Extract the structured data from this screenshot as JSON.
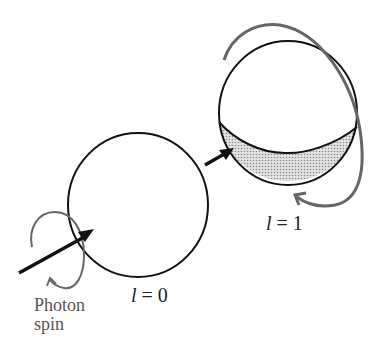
{
  "diagram": {
    "labels": {
      "l0": {
        "symbol": "l",
        "rest": " = 0"
      },
      "l1": {
        "symbol": "l",
        "rest": " = 1"
      },
      "photon_line1": "Photon",
      "photon_line2": "spin"
    },
    "colors": {
      "outline": "#111111",
      "spin_arrow": "#666666",
      "shade": "#c8c8c8"
    }
  }
}
